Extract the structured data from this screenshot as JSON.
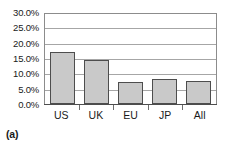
{
  "caption": "(a)",
  "chart_data": {
    "type": "bar",
    "title": "",
    "xlabel": "",
    "ylabel": "",
    "categories": [
      "US",
      "UK",
      "EU",
      "JP",
      "All"
    ],
    "values": [
      16.9,
      14.2,
      7.1,
      8.1,
      7.5
    ],
    "value_labels": [
      "16.9%",
      "14.2%",
      "7.1%",
      "8.1%",
      "7.5%"
    ],
    "ylim": [
      0,
      30
    ],
    "ytick_values": [
      0,
      5,
      10,
      15,
      20,
      25,
      30
    ],
    "ytick_labels": [
      "0.0%",
      "5.0%",
      "10.0%",
      "15.0%",
      "20.0%",
      "25.0%",
      "30.0%"
    ],
    "grid": true,
    "legend": false,
    "series": [
      {
        "name": "",
        "values": [
          16.9,
          14.2,
          7.1,
          8.1,
          7.5
        ]
      }
    ],
    "colors": {
      "bar_fill": "#c9c9c9",
      "bar_border": "#4d4d4d",
      "gridline": "#a6a6a6",
      "axis": "#4d4d4d",
      "text": "#1a1a1a",
      "background": "#ffffff"
    }
  }
}
